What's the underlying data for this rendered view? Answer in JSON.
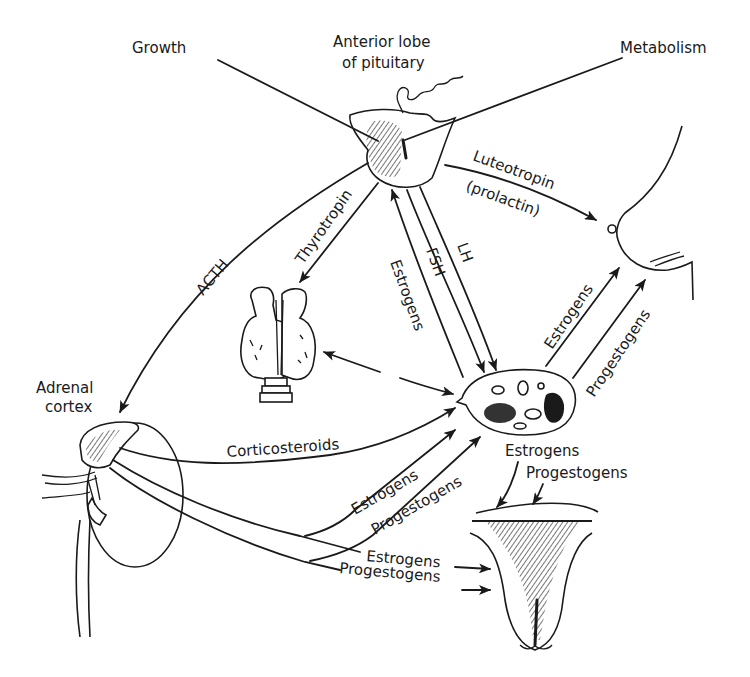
{
  "diagram": {
    "organs": {
      "pituitary": "Anterior lobe of pituitary",
      "pituitary_line1": "Anterior lobe",
      "pituitary_line2": "of pituitary",
      "adrenal_line1": "Adrenal",
      "adrenal_line2": "cortex",
      "thyroid": "thyroid-gland",
      "ovary": "ovary",
      "breast": "breast",
      "uterus": "uterus"
    },
    "effects": {
      "growth": "Growth",
      "metabolism": "Metabolism"
    },
    "hormones": {
      "acth": "ACTH",
      "thyrotropin": "Thyrotropin",
      "luteotropin": "Luteotropin",
      "prolactin": "(prolactin)",
      "fsh": "FSH",
      "lh": "LH",
      "estrogens_feedback": "Estrogens",
      "ovary_to_breast_estrogens": "Estrogens",
      "ovary_to_breast_progestogens": "Progestogens",
      "corticosteroids": "Corticosteroids",
      "adrenal_to_ovary_estrogens": "Estrogens",
      "adrenal_to_ovary_progestogens": "Progestogens",
      "ovary_out_estrogens": "Estrogens",
      "ovary_out_progestogens": "Progestogens",
      "adrenal_to_uterus_estrogens": "Estrogens",
      "adrenal_to_uterus_progestogens": "Progestogens"
    },
    "colors": {
      "ink": "#1a1a1a",
      "background": "#ffffff"
    }
  }
}
